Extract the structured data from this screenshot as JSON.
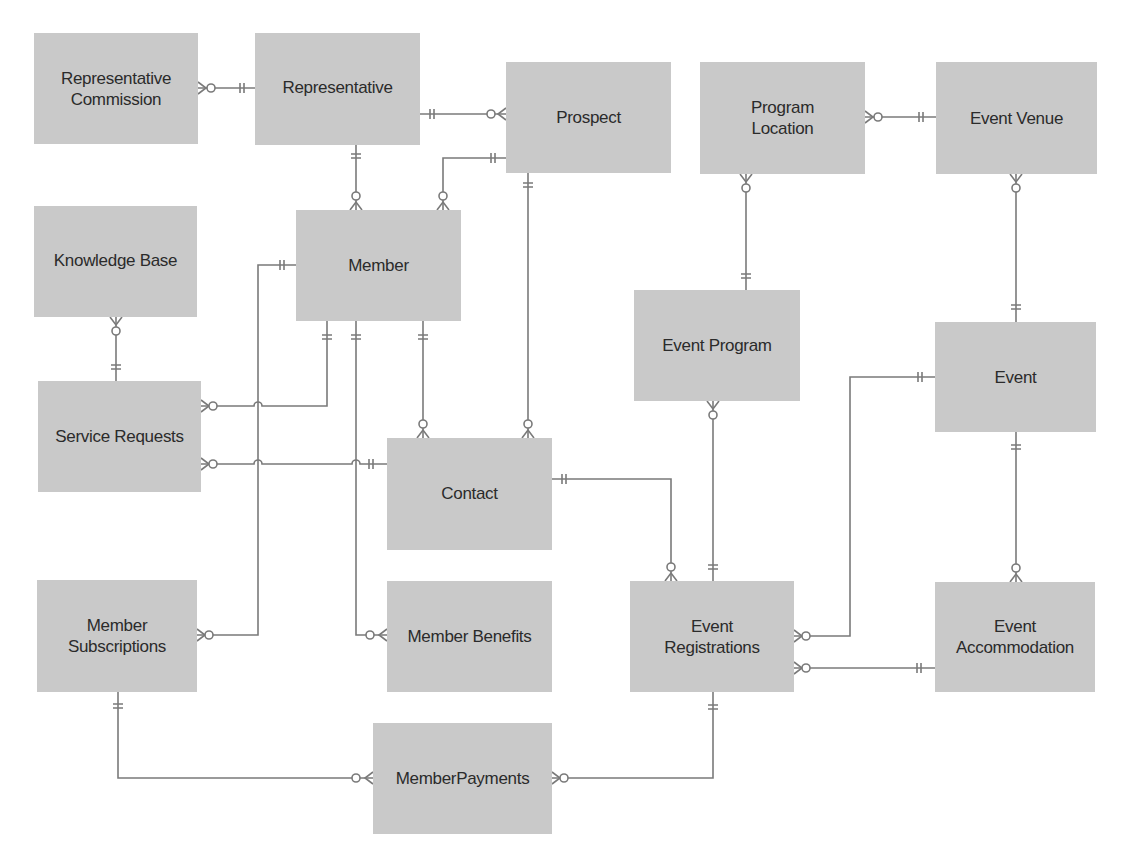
{
  "diagram": {
    "type": "entity-relationship",
    "notation": "crows-foot",
    "colors": {
      "entity_fill": "#c9c9c9",
      "line": "#7a7a7a",
      "text": "#2b2b2b"
    },
    "entities": [
      {
        "id": "rep_commission",
        "label": "Representative Commission",
        "x": 34,
        "y": 33,
        "w": 164,
        "h": 111
      },
      {
        "id": "representative",
        "label": "Representative",
        "x": 255,
        "y": 33,
        "w": 165,
        "h": 112
      },
      {
        "id": "prospect",
        "label": "Prospect",
        "x": 506,
        "y": 62,
        "w": 165,
        "h": 111
      },
      {
        "id": "program_location",
        "label": "Program Location",
        "x": 700,
        "y": 62,
        "w": 165,
        "h": 112
      },
      {
        "id": "event_venue",
        "label": "Event Venue",
        "x": 936,
        "y": 62,
        "w": 161,
        "h": 112
      },
      {
        "id": "knowledge_base",
        "label": "Knowledge Base",
        "x": 34,
        "y": 206,
        "w": 163,
        "h": 111
      },
      {
        "id": "member",
        "label": "Member",
        "x": 296,
        "y": 210,
        "w": 165,
        "h": 111
      },
      {
        "id": "event_program",
        "label": "Event Program",
        "x": 634,
        "y": 290,
        "w": 166,
        "h": 111
      },
      {
        "id": "event",
        "label": "Event",
        "x": 935,
        "y": 322,
        "w": 161,
        "h": 110
      },
      {
        "id": "service_requests",
        "label": "Service Requests",
        "x": 38,
        "y": 381,
        "w": 163,
        "h": 111
      },
      {
        "id": "contact",
        "label": "Contact",
        "x": 387,
        "y": 438,
        "w": 165,
        "h": 112
      },
      {
        "id": "member_subscriptions",
        "label": "Member Subscriptions",
        "x": 37,
        "y": 580,
        "w": 160,
        "h": 112
      },
      {
        "id": "member_benefits",
        "label": "Member Benefits",
        "x": 387,
        "y": 581,
        "w": 165,
        "h": 111
      },
      {
        "id": "event_registrations",
        "label": "Event Registrations",
        "x": 630,
        "y": 581,
        "w": 164,
        "h": 111
      },
      {
        "id": "event_accommodation",
        "label": "Event Accommodation",
        "x": 935,
        "y": 582,
        "w": 160,
        "h": 110
      },
      {
        "id": "member_payments",
        "label": "MemberPayments",
        "x": 373,
        "y": 723,
        "w": 179,
        "h": 111
      }
    ],
    "relationships": [
      {
        "from": "representative",
        "from_card": "one-and-only-one",
        "to": "rep_commission",
        "to_card": "zero-or-many"
      },
      {
        "from": "representative",
        "from_card": "one-and-only-one",
        "to": "prospect",
        "to_card": "zero-or-many"
      },
      {
        "from": "representative",
        "from_card": "one-and-only-one",
        "to": "member",
        "to_card": "zero-or-many"
      },
      {
        "from": "prospect",
        "from_card": "one-and-only-one",
        "to": "member",
        "to_card": "zero-or-many"
      },
      {
        "from": "prospect",
        "from_card": "one-and-only-one",
        "to": "contact",
        "to_card": "zero-or-many"
      },
      {
        "from": "event_venue",
        "from_card": "one-and-only-one",
        "to": "program_location",
        "to_card": "zero-or-many"
      },
      {
        "from": "event_program",
        "from_card": "one-and-only-one",
        "to": "program_location",
        "to_card": "zero-or-many"
      },
      {
        "from": "event",
        "from_card": "one-and-only-one",
        "to": "event_venue",
        "to_card": "zero-or-many"
      },
      {
        "from": "service_requests",
        "from_card": "one-and-only-one",
        "to": "knowledge_base",
        "to_card": "zero-or-many"
      },
      {
        "from": "member",
        "from_card": "one-and-only-one",
        "to": "service_requests",
        "to_card": "zero-or-many"
      },
      {
        "from": "contact",
        "from_card": "one-and-only-one",
        "to": "service_requests",
        "to_card": "zero-or-many"
      },
      {
        "from": "member",
        "from_card": "one-and-only-one",
        "to": "member_subscriptions",
        "to_card": "zero-or-many"
      },
      {
        "from": "member",
        "from_card": "one-and-only-one",
        "to": "member_benefits",
        "to_card": "zero-or-many"
      },
      {
        "from": "member",
        "from_card": "one-and-only-one",
        "to": "contact",
        "to_card": "zero-or-many"
      },
      {
        "from": "contact",
        "from_card": "one-and-only-one",
        "to": "event_registrations",
        "to_card": "zero-or-many"
      },
      {
        "from": "event_registrations",
        "from_card": "one-and-only-one",
        "to": "event_program",
        "to_card": "zero-or-many"
      },
      {
        "from": "event",
        "from_card": "one-and-only-one",
        "to": "event_registrations",
        "to_card": "zero-or-many"
      },
      {
        "from": "event",
        "from_card": "one-and-only-one",
        "to": "event_accommodation",
        "to_card": "zero-or-many"
      },
      {
        "from": "event_accommodation",
        "from_card": "one-and-only-one",
        "to": "event_registrations",
        "to_card": "zero-or-many"
      },
      {
        "from": "member_subscriptions",
        "from_card": "one-and-only-one",
        "to": "member_payments",
        "to_card": "zero-or-many"
      },
      {
        "from": "event_registrations",
        "from_card": "one-and-only-one",
        "to": "member_payments",
        "to_card": "zero-or-many"
      }
    ]
  },
  "labels": {
    "rep_commission": "Representative Commission",
    "representative": "Representative",
    "prospect": "Prospect",
    "program_location": "Program Location",
    "event_venue": "Event Venue",
    "knowledge_base": "Knowledge Base",
    "member": "Member",
    "event_program": "Event Program",
    "event": "Event",
    "service_requests": "Service Requests",
    "contact": "Contact",
    "member_subscriptions": "Member Subscriptions",
    "member_benefits": "Member Benefits",
    "event_registrations": "Event Registrations",
    "event_accommodation": "Event Accommodation",
    "member_payments": "MemberPayments"
  }
}
